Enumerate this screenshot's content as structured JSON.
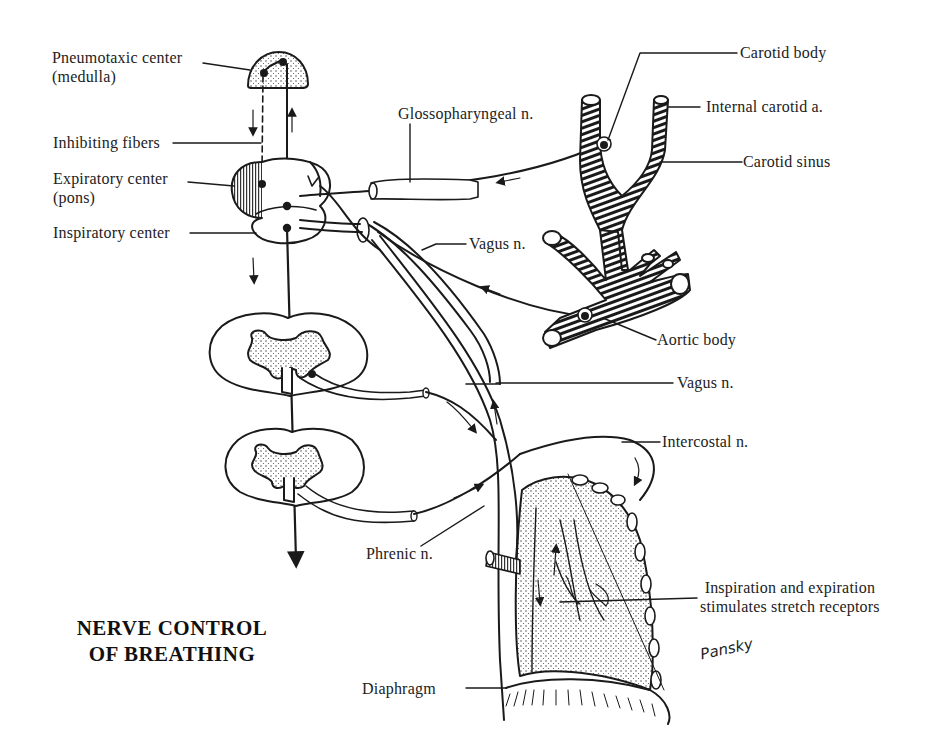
{
  "figure": {
    "title_line1": "NERVE CONTROL",
    "title_line2": "OF BREATHING",
    "signature": "Pansky",
    "stroke_color": "#1a1a1a",
    "background": "#ffffff"
  },
  "labels": {
    "pneumotaxic_center_line1": "Pneumotaxic center",
    "pneumotaxic_center_line2": "(medulla)",
    "inhibiting_fibers": "Inhibiting fibers",
    "expiratory_center_line1": "Expiratory center",
    "expiratory_center_line2": "(pons)",
    "inspiratory_center": "Inspiratory center",
    "glossopharyngeal_n": "Glossopharyngeal n.",
    "carotid_body": "Carotid body",
    "internal_carotid_a": "Internal carotid a.",
    "carotid_sinus": "Carotid sinus",
    "vagus_n_upper": "Vagus n.",
    "aortic_body": "Aortic body",
    "vagus_n_lower": "Vagus n.",
    "intercostal_n": "Intercostal n.",
    "phrenic_n": "Phrenic n.",
    "stretch_receptors_line1": "Inspiration and expiration",
    "stretch_receptors_line2": "stimulates stretch receptors",
    "diaphragm": "Diaphragm"
  }
}
